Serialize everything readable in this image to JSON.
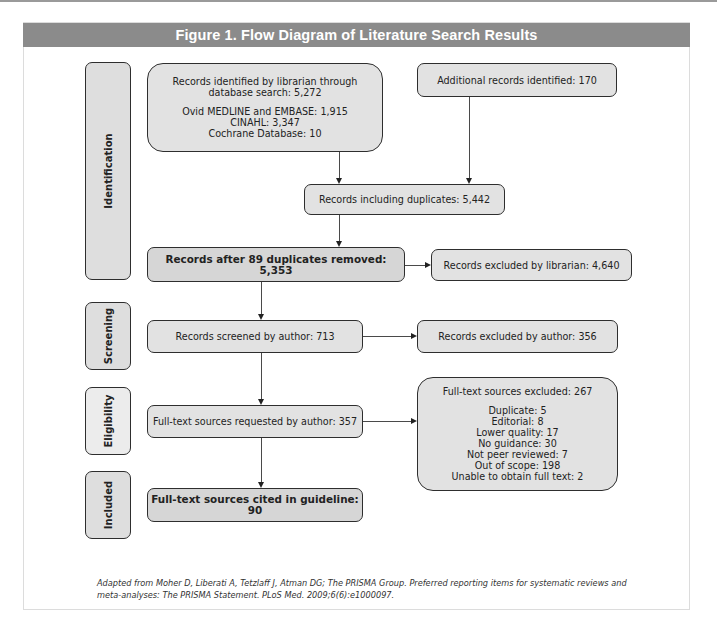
{
  "figure": {
    "title": "Figure 1.  Flow Diagram of Literature Search Results"
  },
  "phases": [
    {
      "label": "Identification"
    },
    {
      "label": "Screening"
    },
    {
      "label": "Eligibility"
    },
    {
      "label": "Included"
    }
  ],
  "identification": {
    "librarian_search": {
      "line1": "Records identified by librarian through",
      "line2": "database search: 5,272",
      "sources": [
        "Ovid MEDLINE and EMBASE: 1,915",
        "CINAHL: 3,347",
        "Cochrane Database: 10"
      ]
    },
    "additional": "Additional records identified: 170",
    "including_duplicates": "Records including duplicates: 5,442",
    "after_duplicates": "Records after 89 duplicates removed: 5,353",
    "excluded_librarian": "Records excluded by librarian: 4,640"
  },
  "screening": {
    "screened": "Records screened by author: 713",
    "excluded_author": "Records excluded by author: 356"
  },
  "eligibility": {
    "requested": "Full-text sources requested by author: 357",
    "excluded": {
      "title": "Full-text sources excluded: 267",
      "reasons": [
        "Duplicate: 5",
        "Editorial: 8",
        "Lower quality: 17",
        "No guidance: 30",
        "Not peer reviewed: 7",
        "Out of scope: 198",
        "Unable to obtain full text: 2"
      ]
    }
  },
  "included": {
    "cited": "Full-text sources cited in guideline: 90"
  },
  "caption": {
    "line1": "Adapted from Moher D, Liberati A, Tetzlaff J, Atman DG; The PRISMA Group. Preferred reporting items for systematic reviews and",
    "line2": "meta-analyses: The PRISMA Statement. PLoS Med. 2009;6(6):e1000097."
  }
}
